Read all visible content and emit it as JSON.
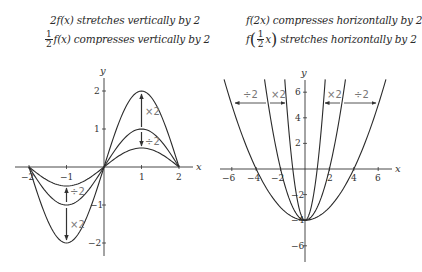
{
  "left_panel": {
    "caption_line1": {
      "prefix": "2f(x)",
      "text": " stretches vertically by 2"
    },
    "caption_line2": {
      "frac_num": "1",
      "frac_den": "2",
      "prefix": "f(x)",
      "text": " compresses vertically by 2"
    },
    "axis_labels": {
      "x": "x",
      "y": "y"
    },
    "x_ticks": [
      "−2",
      "−1",
      "1",
      "2"
    ],
    "y_ticks": [
      "2",
      "1",
      "−1",
      "−2"
    ],
    "op_labels": {
      "upper_stretch": "×2",
      "upper_compress": "÷2",
      "lower_compress": "÷2",
      "lower_stretch": "×2"
    }
  },
  "right_panel": {
    "caption_line1": {
      "prefix": "f(2x)",
      "text": " compresses horizontally by 2"
    },
    "caption_line2": {
      "func": "f",
      "frac_num": "1",
      "frac_den": "2",
      "var": "x",
      "text": " stretches horizontally by 2"
    },
    "axis_labels": {
      "x": "x",
      "y": "y"
    },
    "x_ticks": [
      "−6",
      "−4",
      "−2",
      "2",
      "4",
      "6"
    ],
    "y_ticks": [
      "6",
      "4",
      "2",
      "−2",
      "−4",
      "−6"
    ],
    "op_labels": {
      "left_outer": "÷2",
      "left_inner": "×2",
      "right_inner": "×2",
      "right_outer": "÷2"
    }
  },
  "chart_data": [
    {
      "type": "line",
      "title": "Vertical stretch and compression",
      "xlabel": "x",
      "ylabel": "y",
      "xlim": [
        -2,
        2
      ],
      "ylim": [
        -2,
        2
      ],
      "series": [
        {
          "name": "f(x)",
          "description": "sine-like wave, peak 1 at x=1, trough -1 at x=-1, zeros at -2, 0, 2"
        },
        {
          "name": "2f(x)",
          "description": "peak 2 at x=1, trough -2 at x=-1"
        },
        {
          "name": "1/2 f(x)",
          "description": "peak 0.5 at x=1, trough -0.5 at x=-1"
        }
      ]
    },
    {
      "type": "line",
      "title": "Horizontal compression and stretch",
      "xlabel": "x",
      "ylabel": "y",
      "xlim": [
        -6,
        6
      ],
      "ylim": [
        -6,
        7
      ],
      "series": [
        {
          "name": "f(x)",
          "description": "parabola x^2 - 4, vertex (0,-4), x-intercepts ±2"
        },
        {
          "name": "f(2x)",
          "description": "parabola 4x^2 - 4, vertex (0,-4), x-intercepts ±1"
        },
        {
          "name": "f(1/2 x)",
          "description": "parabola x^2/4 - 4, vertex (0,-4), x-intercepts ±4"
        }
      ]
    }
  ]
}
